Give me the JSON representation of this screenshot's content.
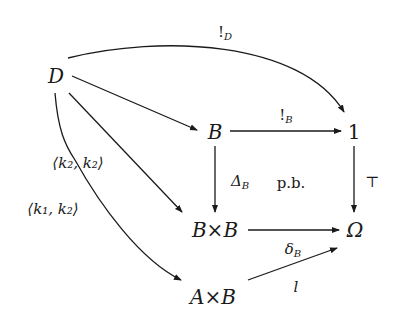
{
  "diagram": {
    "type": "commutative-diagram",
    "nodes": {
      "D": "D",
      "B": "B",
      "one": "1",
      "BxB": "B×B",
      "Omega": "Ω",
      "AxB": "A×B"
    },
    "labels": {
      "bang_D": {
        "main": "!",
        "sub": "D"
      },
      "bang_B": {
        "main": "!",
        "sub": "B"
      },
      "delta_B_cap": {
        "main": "Δ",
        "sub": "B"
      },
      "pb": "p.b.",
      "top": "⊤",
      "k2k2": "⟨k₂, k₂⟩",
      "k1k2": "⟨k₁, k₂⟩",
      "delta_B": {
        "main": "δ",
        "sub": "B"
      },
      "l": "l"
    },
    "edges": [
      {
        "from": "D",
        "to": "1",
        "label": "!_D",
        "shape": "curved"
      },
      {
        "from": "D",
        "to": "B",
        "label": "",
        "shape": "straight"
      },
      {
        "from": "D",
        "to": "B×B",
        "label": "⟨k₂, k₂⟩",
        "shape": "straight"
      },
      {
        "from": "D",
        "to": "A×B",
        "label": "⟨k₁, k₂⟩",
        "shape": "curved"
      },
      {
        "from": "B",
        "to": "1",
        "label": "!_B",
        "shape": "straight"
      },
      {
        "from": "B",
        "to": "B×B",
        "label": "Δ_B",
        "shape": "straight"
      },
      {
        "from": "1",
        "to": "Ω",
        "label": "⊤",
        "shape": "straight"
      },
      {
        "from": "B×B",
        "to": "Ω",
        "label": "δ_B",
        "shape": "straight"
      },
      {
        "from": "A×B",
        "to": "Ω",
        "label": "l",
        "shape": "straight"
      }
    ]
  }
}
